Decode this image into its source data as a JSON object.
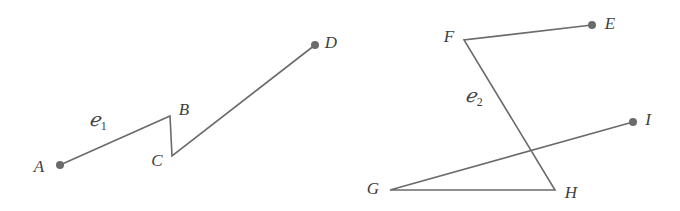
{
  "figure": {
    "background_color": "#ffffff",
    "stroke_color": "#6b6b6b",
    "dot_color": "#6b6b6b",
    "label_color": "#404040",
    "stroke_width": 1.6,
    "dot_radius": 4,
    "width": 680,
    "height": 211,
    "curves": [
      {
        "name": "curve-c1",
        "label": "ℌ",
        "label_script": "ℯ",
        "label_subscript": "1",
        "label_x": 98,
        "label_y": 121,
        "path_points": [
          {
            "point": "A",
            "x": 60,
            "y": 165
          },
          {
            "point": "B",
            "x": 170,
            "y": 116
          },
          {
            "point": "C",
            "x": 172,
            "y": 156
          },
          {
            "point": "D",
            "x": 315,
            "y": 45
          }
        ],
        "endpoint_dots": [
          {
            "point": "A",
            "x": 60,
            "y": 165
          },
          {
            "point": "D",
            "x": 315,
            "y": 45
          }
        ],
        "vertex_labels": [
          {
            "text": "A",
            "x": 39,
            "y": 166
          },
          {
            "text": "B",
            "x": 184,
            "y": 109
          },
          {
            "text": "C",
            "x": 157,
            "y": 160
          },
          {
            "text": "D",
            "x": 331,
            "y": 42
          }
        ]
      },
      {
        "name": "curve-c2",
        "label_script": "ℯ",
        "label_subscript": "2",
        "label_x": 474,
        "label_y": 97,
        "path_points": [
          {
            "point": "E",
            "x": 592,
            "y": 25
          },
          {
            "point": "F",
            "x": 464,
            "y": 40
          },
          {
            "point": "H",
            "x": 555,
            "y": 190
          },
          {
            "point": "G",
            "x": 390,
            "y": 190
          },
          {
            "point": "I",
            "x": 633,
            "y": 122
          }
        ],
        "endpoint_dots": [
          {
            "point": "E",
            "x": 592,
            "y": 25
          },
          {
            "point": "I",
            "x": 633,
            "y": 122
          }
        ],
        "vertex_labels": [
          {
            "text": "E",
            "x": 610,
            "y": 23
          },
          {
            "text": "F",
            "x": 449,
            "y": 36
          },
          {
            "text": "G",
            "x": 373,
            "y": 188
          },
          {
            "text": "H",
            "x": 571,
            "y": 192
          },
          {
            "text": "I",
            "x": 648,
            "y": 119
          }
        ]
      }
    ]
  }
}
